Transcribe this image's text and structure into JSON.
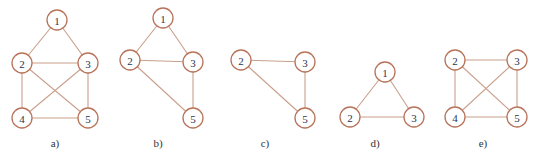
{
  "colors": {
    "node_stroke": "#b8735a",
    "edge": "#c9a08c",
    "label_text": "#2a3550",
    "caption_text": "#333333"
  },
  "node_radius": 10,
  "graphs": [
    {
      "id": "a",
      "caption": "a)",
      "caption_pos": [
        55,
        147
      ],
      "nodes": [
        {
          "id": "1",
          "label": "1",
          "x": 57,
          "y": 20
        },
        {
          "id": "2",
          "label": "2",
          "x": 22,
          "y": 63
        },
        {
          "id": "3",
          "label": "3",
          "x": 88,
          "y": 63
        },
        {
          "id": "4",
          "label": "4",
          "x": 22,
          "y": 118
        },
        {
          "id": "5",
          "label": "5",
          "x": 88,
          "y": 118
        }
      ],
      "edges": [
        [
          "1",
          "2"
        ],
        [
          "1",
          "3"
        ],
        [
          "2",
          "3"
        ],
        [
          "2",
          "4"
        ],
        [
          "2",
          "5"
        ],
        [
          "3",
          "4"
        ],
        [
          "3",
          "5"
        ],
        [
          "4",
          "5"
        ]
      ]
    },
    {
      "id": "b",
      "caption": "b)",
      "caption_pos": [
        158,
        147
      ],
      "nodes": [
        {
          "id": "1",
          "label": "1",
          "x": 163,
          "y": 18
        },
        {
          "id": "2",
          "label": "2",
          "x": 130,
          "y": 60
        },
        {
          "id": "3",
          "label": "3",
          "x": 193,
          "y": 62
        },
        {
          "id": "5",
          "label": "5",
          "x": 193,
          "y": 118
        }
      ],
      "edges": [
        [
          "1",
          "2"
        ],
        [
          "1",
          "3"
        ],
        [
          "2",
          "3"
        ],
        [
          "2",
          "5"
        ],
        [
          "3",
          "5"
        ]
      ]
    },
    {
      "id": "c",
      "caption": "c)",
      "caption_pos": [
        265,
        147
      ],
      "nodes": [
        {
          "id": "2",
          "label": "2",
          "x": 241,
          "y": 60
        },
        {
          "id": "3",
          "label": "3",
          "x": 305,
          "y": 62
        },
        {
          "id": "5",
          "label": "5",
          "x": 305,
          "y": 118
        }
      ],
      "edges": [
        [
          "2",
          "3"
        ],
        [
          "2",
          "5"
        ],
        [
          "3",
          "5"
        ]
      ]
    },
    {
      "id": "d",
      "caption": "d)",
      "caption_pos": [
        375,
        147
      ],
      "nodes": [
        {
          "id": "1",
          "label": "1",
          "x": 385,
          "y": 72
        },
        {
          "id": "2",
          "label": "2",
          "x": 350,
          "y": 117
        },
        {
          "id": "3",
          "label": "3",
          "x": 414,
          "y": 117
        }
      ],
      "edges": [
        [
          "1",
          "2"
        ],
        [
          "1",
          "3"
        ],
        [
          "2",
          "3"
        ]
      ]
    },
    {
      "id": "e",
      "caption": "e)",
      "caption_pos": [
        483,
        147
      ],
      "nodes": [
        {
          "id": "2",
          "label": "2",
          "x": 455,
          "y": 60
        },
        {
          "id": "3",
          "label": "3",
          "x": 517,
          "y": 60
        },
        {
          "id": "4",
          "label": "4",
          "x": 455,
          "y": 117
        },
        {
          "id": "5",
          "label": "5",
          "x": 517,
          "y": 117
        }
      ],
      "edges": [
        [
          "2",
          "3"
        ],
        [
          "2",
          "4"
        ],
        [
          "2",
          "5"
        ],
        [
          "3",
          "4"
        ],
        [
          "3",
          "5"
        ],
        [
          "4",
          "5"
        ]
      ]
    }
  ]
}
